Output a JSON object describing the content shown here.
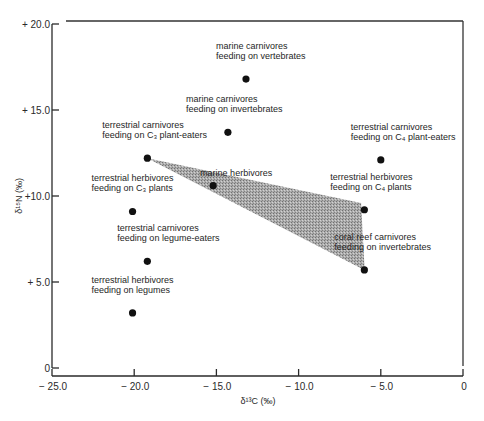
{
  "chart_data": {
    "type": "scatter",
    "title": "",
    "xlabel": "δ¹³C (‰)",
    "ylabel": "δ¹⁵N (‰)",
    "xlim": [
      -25.0,
      0
    ],
    "ylim": [
      0,
      20.0
    ],
    "grid": false,
    "legend": null,
    "x_ticks": [
      {
        "value": -25.0,
        "label": "− 25.0"
      },
      {
        "value": -20.0,
        "label": "− 20.0"
      },
      {
        "value": -15.0,
        "label": "− 15.0"
      },
      {
        "value": -10.0,
        "label": "− 10.0"
      },
      {
        "value": -5.0,
        "label": "− 5.0"
      },
      {
        "value": 0,
        "label": "0"
      }
    ],
    "y_ticks": [
      {
        "value": 0,
        "label": "0"
      },
      {
        "value": 5.0,
        "label": "+ 5.0"
      },
      {
        "value": 10.0,
        "label": "+10.0"
      },
      {
        "value": 15.0,
        "label": "+ 15.0"
      },
      {
        "value": 20.0,
        "label": "+ 20.0"
      }
    ],
    "points": [
      {
        "id": "marine-carnivores-vertebrates",
        "x": -13.2,
        "y": 16.8,
        "label": [
          "marine carnivores",
          "feeding on vertebrates"
        ],
        "label_dx": -30,
        "label_dy": -20
      },
      {
        "id": "marine-carnivores-invertebrates",
        "x": -14.3,
        "y": 13.7,
        "label": [
          "marine carnivores",
          "feeding on invertebrates"
        ],
        "label_dx": -42,
        "label_dy": -20
      },
      {
        "id": "terrestrial-carnivores-c3",
        "x": -19.2,
        "y": 12.2,
        "label": [
          "terrestrial carnivores",
          "feeding on C₃ plant-eaters"
        ],
        "label_dx": -45,
        "label_dy": -20
      },
      {
        "id": "terrestrial-carnivores-c4",
        "x": -5.0,
        "y": 12.1,
        "label": [
          "terrestrial carnivores",
          "feeding on C₄ plant-eaters"
        ],
        "label_dx": -30,
        "label_dy": -20
      },
      {
        "id": "marine-herbivores",
        "x": -15.2,
        "y": 10.6,
        "label": [
          "marine herbivores"
        ],
        "label_dx": -13,
        "label_dy": -10
      },
      {
        "id": "terrestrial-herbivores-c3",
        "x": -20.1,
        "y": 9.1,
        "label": [
          "terrestrial herbivores",
          "feeding on C₃ plants"
        ],
        "label_dx": -41,
        "label_dy": -20
      },
      {
        "id": "terrestrial-herbivores-c4",
        "x": -6.0,
        "y": 9.2,
        "label": [
          "terrestrial herbivores",
          "feeding on C₄ plants"
        ],
        "label_dx": -34,
        "label_dy": -20
      },
      {
        "id": "terrestrial-carnivores-legume-eaters",
        "x": -19.2,
        "y": 6.2,
        "label": [
          "terrestrial carnivores",
          "feeding on legume-eaters"
        ],
        "label_dx": -30,
        "label_dy": -20
      },
      {
        "id": "coral-reef-carnivores",
        "x": -6.0,
        "y": 5.7,
        "label": [
          "coral reef carnivores",
          "feeding on invertebrates"
        ],
        "label_dx": -30,
        "label_dy": -20
      },
      {
        "id": "terrestrial-herbivores-legumes",
        "x": -20.1,
        "y": 3.2,
        "label": [
          "terrestrial herbivores",
          "feeding on legumes"
        ],
        "label_dx": -41,
        "label_dy": -20
      }
    ],
    "shaded_region": {
      "description": "marine food web range",
      "vertices": [
        [
          -19.2,
          12.2
        ],
        [
          -6.2,
          9.6
        ],
        [
          -6.0,
          6.0
        ],
        [
          -6.0,
          5.7
        ]
      ],
      "color": "#9a9a9a"
    }
  },
  "layout": {
    "plot": {
      "x0": 52,
      "x1": 463,
      "y0": 368,
      "y1": 24
    },
    "x_axis_y": 376,
    "colors": {
      "axis": "#2a2a2a",
      "dot": "#111111",
      "shade": "#9a9a9a"
    }
  }
}
